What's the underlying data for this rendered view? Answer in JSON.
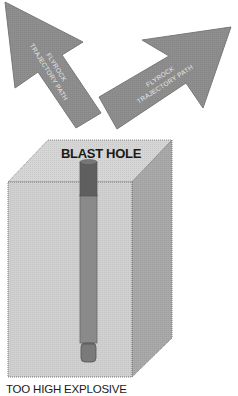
{
  "diagram": {
    "arrows": [
      {
        "id": "left",
        "line1": "FLYROCK",
        "line2": "TRAJECTORY PATH"
      },
      {
        "id": "right",
        "line1": "FLYROCK",
        "line2": "TRAJECTORY PATH"
      }
    ],
    "block": {
      "title": "BLAST HOLE"
    },
    "caption": "TOO HIGH EXPLOSIVE",
    "colors": {
      "arrow_fill": "#8e8e8e",
      "arrow_stroke": "#6e6e6e",
      "top_face": "#d6d6d6",
      "front_face": "#d0d0d0",
      "side_face": "#a9a9a9",
      "stemming": "#5f5f5f",
      "explosive_column": "#8a8a8a",
      "primer": "#7a7a7a"
    }
  }
}
